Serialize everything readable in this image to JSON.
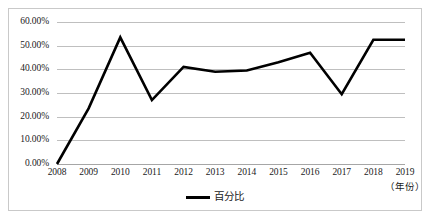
{
  "chart_data": {
    "type": "line",
    "title": "",
    "xlabel": "（年份）",
    "ylabel": "",
    "categories": [
      "2008",
      "2009",
      "2010",
      "2011",
      "2012",
      "2013",
      "2014",
      "2015",
      "2016",
      "2017",
      "2018",
      "2019"
    ],
    "series": [
      {
        "name": "百分比",
        "color": "#000000",
        "values": [
          0.0,
          23.5,
          53.5,
          27.0,
          41.0,
          39.0,
          39.5,
          43.0,
          47.0,
          29.5,
          52.5,
          52.5
        ]
      }
    ],
    "ylim": [
      0,
      60
    ],
    "ytick_values": [
      0,
      10,
      20,
      30,
      40,
      50,
      60
    ],
    "ytick_labels": [
      "0.00%",
      "10.00%",
      "20.00%",
      "30.00%",
      "40.00%",
      "50.00%",
      "60.00%"
    ],
    "grid": true,
    "legend_position": "bottom",
    "legend": [
      {
        "label": "百分比",
        "color": "#000000",
        "marker": "line-swatch"
      }
    ]
  },
  "style": {
    "line_color": "#000000",
    "grid_color": "#bfbfbf",
    "border_color": "#c9c9c9",
    "text_color": "#1a1a1a"
  }
}
